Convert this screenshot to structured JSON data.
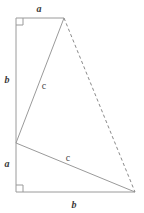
{
  "figure": {
    "background_color": "#ffffff",
    "stroke_color": "#9a9a9a",
    "dashed_stroke_color": "#8a8a8a",
    "label_color": "#3a3a3a",
    "stroke_width": 1,
    "width": 144,
    "height": 213
  },
  "labels": {
    "top_a": "a",
    "left_b": "b",
    "left_a": "a",
    "bottom_b": "b",
    "upper_c": "c",
    "lower_c": "c"
  },
  "geometry": {
    "points": {
      "top_left": {
        "x": 16,
        "y": 18
      },
      "apex": {
        "x": 64,
        "y": 18
      },
      "mid_left": {
        "x": 16,
        "y": 143
      },
      "bottom_left": {
        "x": 16,
        "y": 192
      },
      "bottom_right": {
        "x": 135,
        "y": 192
      }
    },
    "segments": [
      {
        "name": "top-edge-a",
        "from": "top_left",
        "to": "apex",
        "style": "solid",
        "label": "a"
      },
      {
        "name": "left-edge-b",
        "from": "top_left",
        "to": "mid_left",
        "style": "solid",
        "label": "b"
      },
      {
        "name": "left-edge-a",
        "from": "mid_left",
        "to": "bottom_left",
        "style": "solid",
        "label": "a"
      },
      {
        "name": "bottom-edge-b",
        "from": "bottom_left",
        "to": "bottom_right",
        "style": "solid",
        "label": "b"
      },
      {
        "name": "hypotenuse-upper-c",
        "from": "mid_left",
        "to": "apex",
        "style": "solid",
        "label": "c"
      },
      {
        "name": "hypotenuse-lower-c",
        "from": "mid_left",
        "to": "bottom_right",
        "style": "solid",
        "label": "c"
      },
      {
        "name": "dashed-closing-edge",
        "from": "apex",
        "to": "bottom_right",
        "style": "dashed",
        "label": ""
      }
    ],
    "right_angle_markers": [
      {
        "name": "right-angle-top-left",
        "x": 16,
        "y": 18,
        "size": 7,
        "direction": "down-right"
      },
      {
        "name": "right-angle-bottom-left",
        "x": 16,
        "y": 192,
        "size": 7,
        "direction": "up-right"
      }
    ]
  },
  "label_positions": {
    "top_a": {
      "x": 39,
      "y": 9
    },
    "left_b": {
      "x": 7,
      "y": 80
    },
    "left_a": {
      "x": 7,
      "y": 164
    },
    "bottom_b": {
      "x": 74,
      "y": 205
    },
    "upper_c": {
      "x": 44,
      "y": 86
    },
    "lower_c": {
      "x": 68,
      "y": 158
    }
  }
}
